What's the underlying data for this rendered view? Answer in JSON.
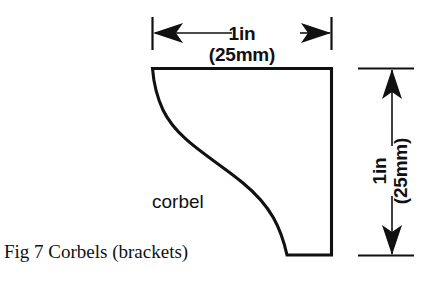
{
  "figure": {
    "caption": "Fig 7 Corbels (brackets)",
    "part_label": "corbel",
    "ink_color": "#111111",
    "background_color": "#ffffff"
  },
  "dimensions": {
    "width": {
      "name": "horizontal-width-dimension",
      "primary": "1in",
      "secondary": "(25mm)",
      "orientation": "horizontal"
    },
    "height": {
      "name": "vertical-height-dimension",
      "primary": "1in",
      "secondary": "(25mm)",
      "orientation": "vertical-rotated"
    }
  }
}
